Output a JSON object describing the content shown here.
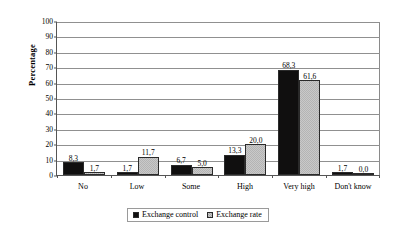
{
  "chart_data": {
    "type": "bar",
    "title": "",
    "subtitle": "",
    "xlabel": "",
    "ylabel": "Percentage",
    "ylim": [
      0,
      100
    ],
    "ytick_step": 10,
    "ytick_labels": [
      "0",
      "10",
      "20",
      "30",
      "40",
      "50",
      "60",
      "70",
      "80",
      "90",
      "100"
    ],
    "grid": "horizontal",
    "legend_position": "bottom-center",
    "decimal_separator": ",",
    "categories": [
      "No",
      "Low",
      "Some",
      "High",
      "Very high",
      "Don't know"
    ],
    "series": [
      {
        "name": "Exchange control",
        "color": "#100f0f",
        "fill": "solid-black",
        "values": [
          8.3,
          1.7,
          6.7,
          13.3,
          68.3,
          1.7
        ],
        "labels": [
          "8,3",
          "1,7",
          "6,7",
          "13,3",
          "68,3",
          "1,7"
        ]
      },
      {
        "name": "Exchange rate",
        "color": "#c9c9c9",
        "fill": "light-gray-checkered",
        "values": [
          1.7,
          11.7,
          5.0,
          20.0,
          61.6,
          0.0
        ],
        "labels": [
          "1,7",
          "11,7",
          "5,0",
          "20,0",
          "61,6",
          "0,0"
        ]
      }
    ]
  },
  "colors": {
    "series_1": "#100f0f",
    "series_2": "#c9c9c9",
    "gridline": "#909090",
    "axis": "#555555",
    "background": "#ffffff"
  }
}
